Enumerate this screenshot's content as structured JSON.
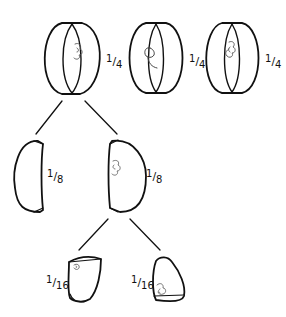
{
  "diagram": {
    "colors": {
      "stroke": "#111111",
      "core": "#555555",
      "background": "#ffffff"
    },
    "row_quarters": [
      {
        "label": {
          "num": "1",
          "den": "4"
        },
        "variant": "core-right"
      },
      {
        "label": {
          "num": "1",
          "den": "4"
        },
        "variant": "core-left-open"
      },
      {
        "label": {
          "num": "1",
          "den": "4"
        },
        "variant": "core-center"
      }
    ],
    "row_eighths": [
      {
        "label": {
          "num": "1",
          "den": "8"
        },
        "variant": "plain"
      },
      {
        "label": {
          "num": "1",
          "den": "8"
        },
        "variant": "with-core"
      }
    ],
    "row_sixteenths": [
      {
        "label": {
          "num": "1",
          "den": "16"
        },
        "variant": "top-core"
      },
      {
        "label": {
          "num": "1",
          "den": "16"
        },
        "variant": "bottom-core"
      }
    ]
  }
}
